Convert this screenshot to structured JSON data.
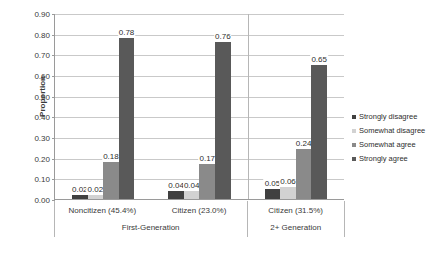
{
  "chart_data": {
    "type": "bar",
    "title": "",
    "xlabel": "",
    "ylabel": "Proportion",
    "ylim": [
      0.0,
      0.9
    ],
    "ytick_step": 0.1,
    "grid": true,
    "legend_position": "right",
    "categories": [
      "Noncitizen (45.4%)",
      "Citizen (23.0%)",
      "Citizen (31.5%)"
    ],
    "group_labels": [
      "First-Generation",
      "2+ Generation"
    ],
    "group_spans": [
      2,
      1
    ],
    "series": [
      {
        "name": "Strongly disagree",
        "color": "#404040",
        "values": [
          0.02,
          0.04,
          0.05
        ]
      },
      {
        "name": "Somewhat disagree",
        "color": "#d2d2d2",
        "values": [
          0.02,
          0.04,
          0.06
        ]
      },
      {
        "name": "Somewhat agree",
        "color": "#8a8a8a",
        "values": [
          0.18,
          0.17,
          0.24
        ]
      },
      {
        "name": "Strongly agree",
        "color": "#595959",
        "values": [
          0.78,
          0.76,
          0.65
        ]
      }
    ],
    "value_labels": [
      [
        "0.02",
        "0.02",
        "0.18",
        "0.78"
      ],
      [
        "0.04",
        "0.04",
        "0.17",
        "0.76"
      ],
      [
        "0.05",
        "0.06",
        "0.24",
        "0.65"
      ]
    ],
    "ytick_labels": [
      "0.90",
      "0.80",
      "0.70",
      "0.60",
      "0.50",
      "0.40",
      "0.30",
      "0.20",
      "0.10",
      "0.00"
    ],
    "ytick_values": [
      0.9,
      0.8,
      0.7,
      0.6,
      0.5,
      0.4,
      0.3,
      0.2,
      0.1,
      0.0
    ]
  },
  "axis": {
    "y_title": "Proportion"
  },
  "legend": {
    "items": [
      {
        "label": "Strongly disagree"
      },
      {
        "label": "Somewhat disagree"
      },
      {
        "label": "Somewhat agree"
      },
      {
        "label": "Strongly agree"
      }
    ]
  },
  "colors": {
    "strongly_disagree": "#404040",
    "somewhat_disagree": "#d2d2d2",
    "somewhat_agree": "#8a8a8a",
    "strongly_agree": "#595959",
    "gridline": "#c9c9c9",
    "axis": "#9a9a9a",
    "text": "#3a3a3a",
    "background": "#ffffff"
  }
}
